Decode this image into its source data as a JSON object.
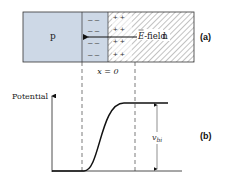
{
  "figure": {
    "panel_a": {
      "label": "(a)",
      "p_region_label": "p",
      "n_region_label": "n",
      "field_label_symbol": "E",
      "field_label_suffix": "-field",
      "junction_label": "x = 0",
      "negative_charge": "–  –",
      "positive_charge": "+  +",
      "colors": {
        "p_fill": "#cdd8e6",
        "depletion_p_fill": "#cdd8e6",
        "n_fill": "#ffffff",
        "hatch": "#555555",
        "outline": "#333333"
      }
    },
    "panel_b": {
      "label": "(b)",
      "y_axis_label": "Potential",
      "built_in_label_main": "v",
      "built_in_label_sub": "bi"
    }
  }
}
